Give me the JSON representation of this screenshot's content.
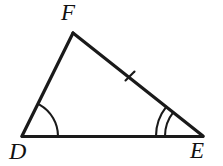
{
  "figure": {
    "name": "triangle-dfe",
    "type": "geometry-diagram",
    "background_color": "#ffffff",
    "stroke_color": "#1a1a1a",
    "canvas": {
      "width": 223,
      "height": 166
    }
  },
  "labels": {
    "F": "F",
    "D": "D",
    "E": "E"
  },
  "vertices": [
    {
      "id": "D",
      "label": "D",
      "x": 22,
      "y": 136
    },
    {
      "id": "E",
      "label": "E",
      "x": 203,
      "y": 136
    },
    {
      "id": "F",
      "label": "F",
      "x": 73,
      "y": 33
    }
  ],
  "sides": [
    {
      "id": "DE",
      "from": "D",
      "to": "E",
      "tick_marks": 0,
      "stroke_width": 3.2
    },
    {
      "id": "DF",
      "from": "D",
      "to": "F",
      "tick_marks": 0,
      "stroke_width": 3.2
    },
    {
      "id": "FE",
      "from": "F",
      "to": "E",
      "tick_marks": 1,
      "stroke_width": 3.2
    }
  ],
  "angle_marks": [
    {
      "id": "angle-D",
      "vertex": "D",
      "arcs": 1,
      "radii": [
        36
      ]
    },
    {
      "id": "angle-E",
      "vertex": "E",
      "arcs": 2,
      "radii": [
        38,
        47
      ]
    }
  ],
  "tick_marks": [
    {
      "id": "tick-FE",
      "on_side": "FE",
      "position_x": 130,
      "position_y": 76,
      "count": 1
    }
  ]
}
